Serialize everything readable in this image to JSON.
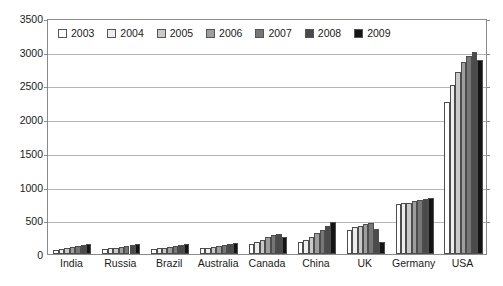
{
  "chart_data": {
    "type": "bar",
    "title": "",
    "xlabel": "",
    "ylabel": "",
    "ylim": [
      0,
      3500
    ],
    "ytick_step": 500,
    "yticks": [
      "0",
      "500",
      "1000",
      "1500",
      "2000",
      "2500",
      "3000",
      "3500"
    ],
    "grid": true,
    "legend_position": "top-left-inside",
    "categories": [
      "India",
      "Russia",
      "Brazil",
      "Australia",
      "Canada",
      "China",
      "UK",
      "Germany",
      "USA"
    ],
    "series": [
      {
        "name": "2003",
        "color": "#ffffff",
        "values": [
          62,
          70,
          72,
          85,
          150,
          185,
          350,
          740,
          2250
        ]
      },
      {
        "name": "2004",
        "color": "#ededed",
        "values": [
          72,
          85,
          82,
          95,
          180,
          215,
          395,
          750,
          2500
        ]
      },
      {
        "name": "2005",
        "color": "#c9c9c9",
        "values": [
          82,
          95,
          95,
          110,
          215,
          255,
          420,
          760,
          2700
        ]
      },
      {
        "name": "2006",
        "color": "#9e9e9e",
        "values": [
          100,
          110,
          105,
          120,
          255,
          310,
          450,
          790,
          2850
        ]
      },
      {
        "name": "2007",
        "color": "#767676",
        "values": [
          118,
          125,
          125,
          135,
          280,
          360,
          460,
          800,
          2930
        ]
      },
      {
        "name": "2008",
        "color": "#4a4a4a",
        "values": [
          135,
          140,
          140,
          150,
          290,
          410,
          370,
          815,
          3000
        ]
      },
      {
        "name": "2009",
        "color": "#141414",
        "values": [
          150,
          155,
          150,
          165,
          245,
          470,
          180,
          830,
          2870
        ]
      }
    ]
  },
  "legend": {
    "items": [
      {
        "label": "2003"
      },
      {
        "label": "2004"
      },
      {
        "label": "2005"
      },
      {
        "label": "2006"
      },
      {
        "label": "2007"
      },
      {
        "label": "2008"
      },
      {
        "label": "2009"
      }
    ]
  }
}
